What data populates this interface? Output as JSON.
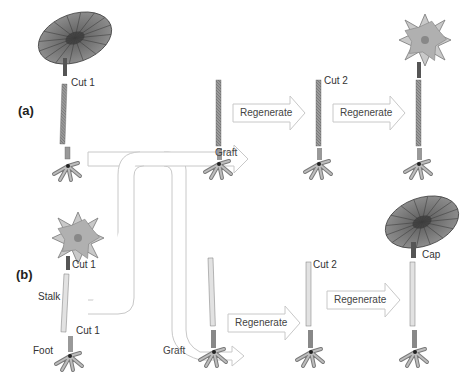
{
  "rows": [
    {
      "id": "a",
      "label": "(a)",
      "start_cap": "disc",
      "labels": {
        "cut1": "Cut 1"
      },
      "steps": [
        {
          "stage": "grafted",
          "label": "Graft"
        },
        {
          "stage": "regenerated-1",
          "label": "Regenerate",
          "cut_label": "Cut 2"
        },
        {
          "stage": "regenerated-2",
          "label": "Regenerate",
          "final_cap": "star"
        }
      ]
    },
    {
      "id": "b",
      "label": "(b)",
      "start_cap": "star",
      "labels": {
        "cut1_top": "Cut 1",
        "stalk": "Stalk",
        "cut1_bottom": "Cut 1",
        "foot": "Foot"
      },
      "steps": [
        {
          "stage": "grafted",
          "label": "Graft"
        },
        {
          "stage": "regenerated-1",
          "label": "Regenerate",
          "cut_label": "Cut 2"
        },
        {
          "stage": "regenerated-2",
          "label": "Regenerate",
          "final_cap": "disc",
          "cap_label": "Cap"
        }
      ]
    }
  ],
  "colors": {
    "stalk": "#8a8a8a",
    "stalk_dark": "#555555",
    "cap_disc": "#7a7a7a",
    "cap_star": "#bdbdbd",
    "arrow_stroke": "#c8c8c8",
    "arrow_fill": "#ffffff"
  }
}
